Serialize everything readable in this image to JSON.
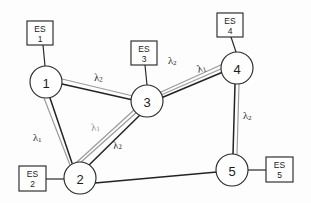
{
  "diagram": {
    "type": "network-graph",
    "width": 311,
    "height": 203,
    "colors": {
      "background": "#fdfdfd",
      "node_stroke": "#2a2a2a",
      "link_dark": "#232323",
      "link_gray": "#9b9b9b",
      "text": "#1c1c1c",
      "label_gray": "#8d8d8d"
    }
  },
  "nodes": [
    {
      "id": "node-1",
      "label": "1",
      "cx": 46,
      "cy": 82,
      "r": 16
    },
    {
      "id": "node-2",
      "label": "2",
      "cx": 80,
      "cy": 178,
      "r": 16
    },
    {
      "id": "node-3",
      "label": "3",
      "cx": 147,
      "cy": 101,
      "r": 16
    },
    {
      "id": "node-4",
      "label": "4",
      "cx": 237,
      "cy": 68,
      "r": 16
    },
    {
      "id": "node-5",
      "label": "5",
      "cx": 232,
      "cy": 170,
      "r": 16
    }
  ],
  "end_systems": [
    {
      "id": "es-1",
      "line1": "ES",
      "line2": "1",
      "x": 27,
      "y": 21,
      "w": 26,
      "h": 24,
      "attached_to": "node-1"
    },
    {
      "id": "es-2",
      "line1": "ES",
      "line2": "2",
      "x": 19,
      "y": 166,
      "w": 27,
      "h": 25,
      "attached_to": "node-2"
    },
    {
      "id": "es-3",
      "line1": "ES",
      "line2": "3",
      "x": 131,
      "y": 41,
      "w": 26,
      "h": 24,
      "attached_to": "node-3"
    },
    {
      "id": "es-4",
      "line1": "ES",
      "line2": "4",
      "x": 217,
      "y": 13,
      "w": 26,
      "h": 24,
      "attached_to": "node-4"
    },
    {
      "id": "es-5",
      "line1": "ES",
      "line2": "5",
      "x": 266,
      "y": 157,
      "w": 27,
      "h": 25,
      "attached_to": "node-5"
    }
  ],
  "links": [
    {
      "id": "link-1-3",
      "from": "node-1",
      "to": "node-3",
      "style": "double"
    },
    {
      "id": "link-1-2",
      "from": "node-1",
      "to": "node-2",
      "style": "double"
    },
    {
      "id": "link-2-3",
      "from": "node-2",
      "to": "node-3",
      "style": "double"
    },
    {
      "id": "link-3-4",
      "from": "node-3",
      "to": "node-4",
      "style": "triple"
    },
    {
      "id": "link-4-5",
      "from": "node-4",
      "to": "node-5",
      "style": "double"
    },
    {
      "id": "link-2-5",
      "from": "node-2",
      "to": "node-5",
      "style": "single"
    }
  ],
  "wavelength_labels": [
    {
      "id": "lambda-1-3",
      "symbol": "λ",
      "subscript": "2",
      "text": "λ2",
      "x": 94,
      "y": 77,
      "tone": "dark",
      "rotate": -3,
      "link": "link-1-3"
    },
    {
      "id": "lambda-1-2",
      "symbol": "λ",
      "subscript": "1",
      "text": "λ1",
      "x": 33,
      "y": 137,
      "tone": "dark",
      "rotate": 0,
      "link": "link-1-2"
    },
    {
      "id": "lambda-2-3-a",
      "symbol": "λ",
      "subscript": "1",
      "text": "λ1",
      "x": 91,
      "y": 127,
      "tone": "gray",
      "rotate": -8,
      "link": "link-2-3"
    },
    {
      "id": "lambda-2-3-b",
      "symbol": "λ",
      "subscript": "2",
      "text": "λ2",
      "x": 113,
      "y": 145,
      "tone": "dark",
      "rotate": -8,
      "link": "link-2-3"
    },
    {
      "id": "lambda-3-4-a",
      "symbol": "λ",
      "subscript": "2",
      "text": "λ2",
      "x": 168,
      "y": 60,
      "tone": "dark",
      "rotate": 0,
      "link": "link-3-4"
    },
    {
      "id": "lambda-3-4-b",
      "symbol": "λ",
      "subscript": "1",
      "text": "λ1",
      "x": 197,
      "y": 69,
      "tone": "dark",
      "rotate": -18,
      "link": "link-3-4"
    },
    {
      "id": "lambda-4-5",
      "symbol": "λ",
      "subscript": "2",
      "text": "λ2",
      "x": 243,
      "y": 115,
      "tone": "dark",
      "rotate": 0,
      "link": "link-4-5"
    }
  ]
}
